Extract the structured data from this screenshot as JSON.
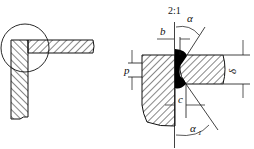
{
  "diagram": {
    "type": "welded corner joint drawing",
    "overview": {
      "description": "corner joint of two plates with detail circle"
    },
    "detail": {
      "scale_label": "2:1",
      "dimension_labels": {
        "root_gap": "b",
        "groove_angle": "α",
        "root_face": "p",
        "thickness": "δ",
        "offset": "c",
        "backing_angle": "α",
        "backing_angle_subscript": "1"
      }
    },
    "colors": {
      "line": "#111111",
      "weld": "#000000",
      "background": "#ffffff"
    }
  }
}
